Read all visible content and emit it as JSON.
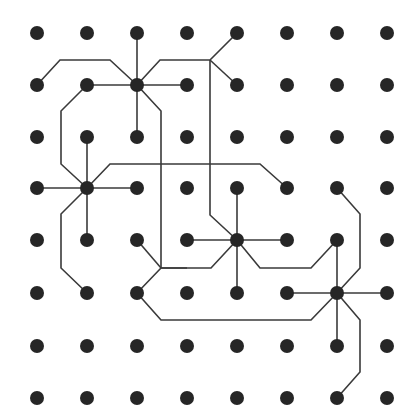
{
  "diagram": {
    "type": "grid-wiring-diagram",
    "grid": {
      "cols": 8,
      "rows": 8,
      "x": [
        37,
        87,
        137,
        187,
        237,
        287,
        337,
        387
      ],
      "y": [
        33,
        85,
        137,
        188,
        240,
        293,
        346,
        398
      ],
      "dot_radius": 7
    },
    "colors": {
      "dot": "#262626",
      "wire": "#3a3a3a",
      "background": "#ffffff"
    },
    "hubs": [
      {
        "id": "hub-1",
        "col": 2,
        "row": 1
      },
      {
        "id": "hub-2",
        "col": 1,
        "row": 3
      },
      {
        "id": "hub-3",
        "col": 4,
        "row": 4
      },
      {
        "id": "hub-4",
        "col": 6,
        "row": 5
      }
    ],
    "wires": [
      {
        "id": "h1-up",
        "points": [
          [
            137,
            33
          ],
          [
            137,
            85
          ]
        ]
      },
      {
        "id": "h1-down",
        "points": [
          [
            137,
            85
          ],
          [
            137,
            137
          ]
        ]
      },
      {
        "id": "h1-right",
        "points": [
          [
            137,
            85
          ],
          [
            187,
            85
          ]
        ]
      },
      {
        "id": "h1-left",
        "points": [
          [
            87,
            85
          ],
          [
            137,
            85
          ]
        ]
      },
      {
        "id": "h1-ul",
        "points": [
          [
            37,
            85
          ],
          [
            60,
            60
          ],
          [
            110,
            60
          ],
          [
            137,
            85
          ]
        ]
      },
      {
        "id": "h1-ur",
        "points": [
          [
            137,
            85
          ],
          [
            160,
            60
          ],
          [
            210,
            60
          ],
          [
            237,
            33
          ]
        ]
      },
      {
        "id": "h1-ur2",
        "points": [
          [
            210,
            60
          ],
          [
            237,
            85
          ]
        ]
      },
      {
        "id": "h1-dr",
        "points": [
          [
            137,
            85
          ],
          [
            161,
            111
          ],
          [
            161,
            268
          ],
          [
            187,
            268
          ]
        ]
      },
      {
        "id": "trunk-210",
        "points": [
          [
            210,
            60
          ],
          [
            210,
            215
          ],
          [
            237,
            240
          ]
        ]
      },
      {
        "id": "h1-left-loop",
        "points": [
          [
            87,
            85
          ],
          [
            61,
            111
          ],
          [
            61,
            164
          ],
          [
            87,
            188
          ]
        ]
      },
      {
        "id": "h2-up",
        "points": [
          [
            87,
            137
          ],
          [
            87,
            188
          ]
        ]
      },
      {
        "id": "h2-down",
        "points": [
          [
            87,
            188
          ],
          [
            87,
            240
          ]
        ]
      },
      {
        "id": "h2-left",
        "points": [
          [
            37,
            188
          ],
          [
            87,
            188
          ]
        ]
      },
      {
        "id": "h2-right",
        "points": [
          [
            87,
            188
          ],
          [
            137,
            188
          ]
        ]
      },
      {
        "id": "h2-ur",
        "points": [
          [
            87,
            188
          ],
          [
            110,
            164
          ],
          [
            260,
            164
          ],
          [
            287,
            188
          ]
        ]
      },
      {
        "id": "h2-dl",
        "points": [
          [
            87,
            188
          ],
          [
            61,
            214
          ],
          [
            61,
            268
          ],
          [
            87,
            293
          ]
        ]
      },
      {
        "id": "n-137-240",
        "points": [
          [
            137,
            240
          ],
          [
            161,
            268
          ]
        ]
      },
      {
        "id": "n-137-293",
        "points": [
          [
            137,
            293
          ],
          [
            161,
            268
          ],
          [
            211,
            268
          ],
          [
            237,
            240
          ]
        ]
      },
      {
        "id": "n-137-293-b",
        "points": [
          [
            137,
            293
          ],
          [
            161,
            320
          ],
          [
            311,
            320
          ],
          [
            337,
            293
          ]
        ]
      },
      {
        "id": "h3-up",
        "points": [
          [
            237,
            188
          ],
          [
            237,
            240
          ]
        ]
      },
      {
        "id": "h3-down",
        "points": [
          [
            237,
            240
          ],
          [
            237,
            293
          ]
        ]
      },
      {
        "id": "h3-left",
        "points": [
          [
            187,
            240
          ],
          [
            237,
            240
          ]
        ]
      },
      {
        "id": "h3-right",
        "points": [
          [
            237,
            240
          ],
          [
            287,
            240
          ]
        ]
      },
      {
        "id": "h3-dr",
        "points": [
          [
            237,
            240
          ],
          [
            260,
            268
          ],
          [
            311,
            268
          ],
          [
            337,
            240
          ]
        ]
      },
      {
        "id": "n-337-188",
        "points": [
          [
            337,
            188
          ],
          [
            360,
            214
          ],
          [
            360,
            268
          ],
          [
            337,
            293
          ]
        ]
      },
      {
        "id": "h4-up",
        "points": [
          [
            337,
            240
          ],
          [
            337,
            293
          ]
        ]
      },
      {
        "id": "h4-down",
        "points": [
          [
            337,
            293
          ],
          [
            337,
            346
          ]
        ]
      },
      {
        "id": "h4-left",
        "points": [
          [
            287,
            293
          ],
          [
            337,
            293
          ]
        ]
      },
      {
        "id": "h4-right",
        "points": [
          [
            337,
            293
          ],
          [
            387,
            293
          ]
        ]
      },
      {
        "id": "h4-dr",
        "points": [
          [
            337,
            293
          ],
          [
            360,
            320
          ],
          [
            360,
            372
          ],
          [
            337,
            398
          ]
        ]
      }
    ]
  }
}
